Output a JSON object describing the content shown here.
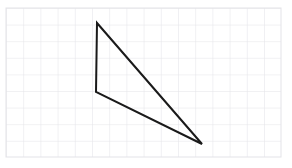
{
  "canvas": {
    "width": 292,
    "height": 168,
    "background_color": "#ffffff"
  },
  "grid": {
    "name": "graph-paper-grid",
    "line_color": "#e3e3e8",
    "line_width": 1,
    "cell_width": 17.2,
    "cell_height": 16.6,
    "origin_x": 6,
    "origin_y": 8,
    "columns": 16,
    "rows": 9,
    "right_edge": 281,
    "bottom_edge": 157
  },
  "figure": {
    "name": "triangle",
    "type": "polygon",
    "stroke_color": "#1a1a1a",
    "stroke_width": 2,
    "fill": "none",
    "closed": true,
    "vertices": [
      {
        "label": "A",
        "x": 97,
        "y": 23
      },
      {
        "label": "B",
        "x": 96,
        "y": 92
      },
      {
        "label": "C",
        "x": 202,
        "y": 144
      }
    ],
    "edges": [
      {
        "name": "edge-AB",
        "from": "A",
        "to": "B"
      },
      {
        "name": "edge-BC",
        "from": "B",
        "to": "C"
      },
      {
        "name": "edge-CA",
        "from": "C",
        "to": "A"
      }
    ],
    "points_string": "97,23 96,92 202,144"
  },
  "labels": {
    "title": "",
    "annotations": []
  }
}
